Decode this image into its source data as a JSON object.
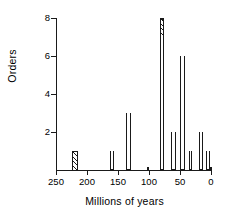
{
  "chart_data": {
    "type": "bar",
    "title": "",
    "subtitle": "",
    "xlabel": "Millions of years",
    "ylabel": "Orders",
    "xlim": [
      250,
      0
    ],
    "ylim": [
      0,
      8
    ],
    "x_reversed": true,
    "grid": false,
    "legend": null,
    "xticks": [
      250,
      200,
      150,
      100,
      50,
      0
    ],
    "xticklabels": [
      "250",
      "200",
      "150",
      "100",
      "50",
      "0"
    ],
    "yticks": [
      2,
      4,
      6,
      8
    ],
    "yticklabels": [
      "2",
      "4",
      "6",
      "8"
    ],
    "bin_width": 10,
    "fills": {
      "open": "white outline",
      "hatch": "diagonal hatched"
    },
    "bars": [
      {
        "x_start": 225,
        "x_end": 215,
        "value": 1,
        "open": 0,
        "hatched": 1
      },
      {
        "x_start": 163,
        "x_end": 156,
        "value": 1,
        "open": 1,
        "hatched": 0
      },
      {
        "x_start": 137,
        "x_end": 129,
        "value": 3,
        "open": 3,
        "hatched": 0
      },
      {
        "x_start": 103,
        "x_end": 101,
        "value": 0.18,
        "open": 0.18,
        "hatched": 0
      },
      {
        "x_start": 82,
        "x_end": 75,
        "value": 8,
        "open": 7,
        "hatched": 1
      },
      {
        "x_start": 64,
        "x_end": 56,
        "value": 2,
        "open": 2,
        "hatched": 0
      },
      {
        "x_start": 50,
        "x_end": 42,
        "value": 6,
        "open": 6,
        "hatched": 0
      },
      {
        "x_start": 36,
        "x_end": 30,
        "value": 1,
        "open": 1,
        "hatched": 0
      },
      {
        "x_start": 20,
        "x_end": 13,
        "value": 2,
        "open": 2,
        "hatched": 0
      },
      {
        "x_start": 8,
        "x_end": 2,
        "value": 1,
        "open": 1,
        "hatched": 0
      },
      {
        "x_start": 2,
        "x_end": 0,
        "value": 0.18,
        "open": 0.18,
        "hatched": 0
      }
    ]
  }
}
